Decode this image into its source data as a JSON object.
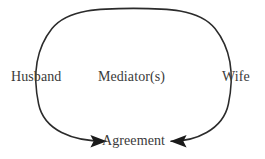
{
  "diagram": {
    "type": "cycle-convergence",
    "background_color": "#ffffff",
    "stroke_color": "#2b2b2b",
    "text_color": "#3a3a3a",
    "nodes": [
      {
        "id": "husband",
        "label": "Husband"
      },
      {
        "id": "mediators",
        "label": "Mediator(s)"
      },
      {
        "id": "wife",
        "label": "Wife"
      },
      {
        "id": "agreement",
        "label": "Agreement"
      }
    ],
    "edges": [
      {
        "id": "husband-to-agreement",
        "from": "husband",
        "to": "agreement",
        "arrowhead": "filled-triangle",
        "direction": "right"
      },
      {
        "id": "wife-to-agreement",
        "from": "wife",
        "to": "agreement",
        "arrowhead": "filled-triangle",
        "direction": "left"
      }
    ]
  }
}
